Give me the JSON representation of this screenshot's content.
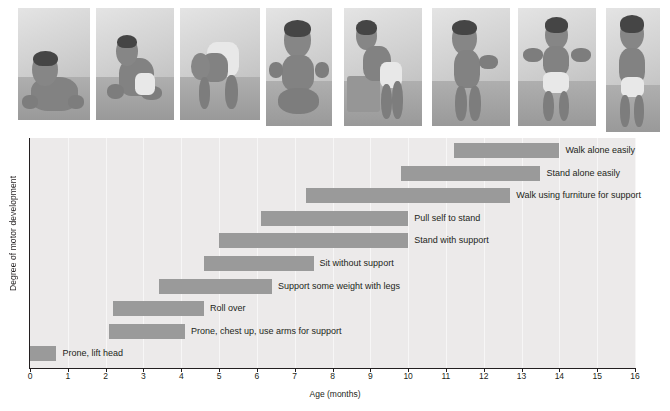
{
  "photos": {
    "count": 8,
    "alt_names": [
      "baby-prone-lifting-head",
      "baby-rolling-over",
      "baby-pushing-up-on-arms",
      "baby-sitting-without-support",
      "baby-pulling-self-to-stand",
      "baby-standing-with-support",
      "baby-walking-with-support",
      "baby-walking-alone"
    ]
  },
  "chart_data": {
    "type": "bar",
    "orientation": "horizontal-range",
    "title": "",
    "xlabel": "Age (months)",
    "ylabel": "Degree of motor development",
    "xlim": [
      0,
      16
    ],
    "xticks": [
      0,
      1,
      2,
      3,
      4,
      5,
      6,
      7,
      8,
      9,
      10,
      11,
      12,
      13,
      14,
      15,
      16
    ],
    "grid": true,
    "legend": "none",
    "bar_color": "#9a9a9a",
    "plot_background": "#eceaea",
    "categories": [
      "Walk alone easily",
      "Stand alone easily",
      "Walk using furniture for support",
      "Pull self to stand",
      "Stand with support",
      "Sit without support",
      "Support some weight with legs",
      "Roll over",
      "Prone, chest up, use arms for support",
      "Prone, lift head"
    ],
    "ranges": [
      {
        "label": "Walk alone easily",
        "start": 11.2,
        "end": 14.0
      },
      {
        "label": "Stand alone easily",
        "start": 9.8,
        "end": 13.5
      },
      {
        "label": "Walk using furniture for support",
        "start": 7.3,
        "end": 12.7
      },
      {
        "label": "Pull self to stand",
        "start": 6.1,
        "end": 10.0
      },
      {
        "label": "Stand with support",
        "start": 5.0,
        "end": 10.0
      },
      {
        "label": "Sit without support",
        "start": 4.6,
        "end": 7.5
      },
      {
        "label": "Support some weight with legs",
        "start": 3.4,
        "end": 6.4
      },
      {
        "label": "Roll over",
        "start": 2.2,
        "end": 4.6
      },
      {
        "label": "Prone, chest up, use arms for support",
        "start": 2.1,
        "end": 4.1
      },
      {
        "label": "Prone, lift head",
        "start": 0.0,
        "end": 0.7
      }
    ]
  }
}
